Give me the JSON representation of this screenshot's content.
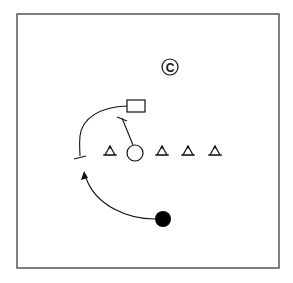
{
  "diagram": {
    "type": "drill-diagram",
    "frame": {
      "x": 17,
      "y": 14,
      "width": 262,
      "height": 254,
      "stroke": "#555555"
    },
    "coach_marker": {
      "symbol": "©",
      "x": 170,
      "y": 67,
      "label": "Coach"
    },
    "cone_row_y": 153,
    "cones": [
      {
        "id": "cone-1",
        "x": 110
      },
      {
        "id": "cone-2",
        "x": 162
      },
      {
        "id": "cone-3",
        "x": 188
      },
      {
        "id": "cone-4",
        "x": 215
      }
    ],
    "target_box": {
      "x": 127,
      "y": 100,
      "width": 18,
      "height": 12
    },
    "defender": {
      "shape": "open-circle",
      "x": 135,
      "y": 153,
      "r": 8
    },
    "attacker": {
      "shape": "filled-circle",
      "x": 163,
      "y": 219,
      "r": 8,
      "color": "#000000"
    },
    "paths": {
      "box_to_left_stop": {
        "kind": "run-with-stop",
        "end_bar": true
      },
      "defender_to_box": {
        "kind": "move-with-stop",
        "end_bar": true
      },
      "attacker_run": {
        "kind": "run-arrow",
        "arrowhead": true
      }
    },
    "colors": {
      "ink": "#111111",
      "background": "#ffffff"
    }
  }
}
